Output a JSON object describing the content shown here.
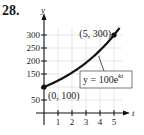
{
  "problem_number": "28.",
  "chart_data": {
    "type": "line",
    "title": "",
    "xlabel": "t",
    "ylabel": "y",
    "x_ticks": [
      1,
      2,
      3,
      4,
      5
    ],
    "y_ticks": [
      50,
      150,
      200,
      250,
      300
    ],
    "xlim": [
      0,
      5.8
    ],
    "ylim": [
      0,
      340
    ],
    "grid": true,
    "series": [
      {
        "name": "y = 100e^{kt}",
        "equation": "y = 100e^(kt)",
        "k": 0.2197,
        "x": [
          0,
          1,
          2,
          3,
          4,
          5
        ],
        "values": [
          100,
          124.6,
          155.2,
          193.3,
          240.8,
          300
        ]
      }
    ],
    "points": [
      {
        "label": "(0, 100)",
        "x": 0,
        "y": 100
      },
      {
        "label": "(5, 300)",
        "x": 5,
        "y": 300
      }
    ],
    "annotations": [
      {
        "text": "y = 100e^{kt}",
        "base": "y = 100e",
        "exponent": "kt"
      }
    ]
  }
}
